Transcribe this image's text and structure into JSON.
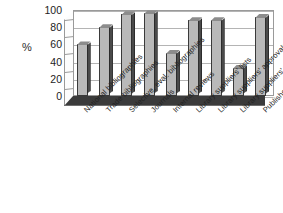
{
  "chart_data": {
    "type": "bar",
    "title": "",
    "subtitle": "",
    "xlabel": "",
    "ylabel": "%",
    "ylim": [
      0,
      100
    ],
    "ytick_labels": [
      "100",
      "80",
      "60",
      "40",
      "20",
      "0"
    ],
    "ytick_values": [
      100,
      80,
      60,
      40,
      20,
      0
    ],
    "grid": true,
    "legend": "none",
    "style": "3d-column-grayscale",
    "categories": [
      "National bibliographies",
      "Trade bibliographies",
      "Selective, eval. bibliographies",
      "Journals",
      "Internal reviews",
      "Library suppliers' lists",
      "Library suppliers' approvals",
      "Library suppliers' CD-ROMs",
      "Publisher lists"
    ],
    "values": [
      60,
      80,
      95,
      96,
      50,
      88,
      88,
      33,
      92
    ],
    "colors": {
      "bar_front": "#b9b9b9",
      "bar_side": "#4a4a4a",
      "bar_top": "#8c8c8c",
      "axis": "#9a9a9a",
      "grid": "#b4b4b4",
      "floor": "#3b3b3b",
      "text": "#1d1d1d",
      "background": "#ffffff"
    }
  }
}
